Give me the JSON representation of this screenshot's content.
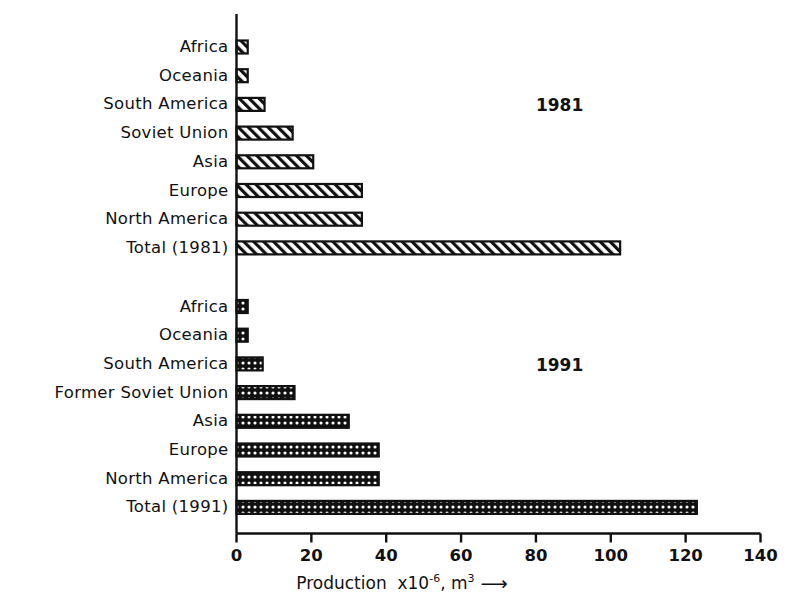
{
  "chart_data": {
    "type": "bar",
    "orientation": "horizontal",
    "title": "",
    "xlabel": "Production x10-6, m3",
    "xlabel_parts": {
      "lead": "Production",
      "factor_base": "x10",
      "factor_exp": "-6",
      "comma": ",",
      "unit_base": "m",
      "unit_exp": "3",
      "arrow": "⟶"
    },
    "ylabel": "",
    "xlim": [
      0,
      140
    ],
    "xticks": [
      0,
      20,
      40,
      60,
      80,
      100,
      120,
      140
    ],
    "xtick_labels": [
      "0",
      "20",
      "40",
      "60",
      "80",
      "100",
      "120",
      "140"
    ],
    "grid": false,
    "legend": "none",
    "annotations": [
      {
        "text": "1981",
        "x_value": 80,
        "group": "1981"
      },
      {
        "text": "1991",
        "x_value": 80,
        "group": "1991"
      }
    ],
    "groups": [
      {
        "name": "1981",
        "annotation": "1981",
        "pattern": "diagonal-hatch",
        "categories": [
          "Africa",
          "Oceania",
          "South America",
          "Soviet Union",
          "Asia",
          "Europe",
          "North America",
          "Total (1981)"
        ],
        "values": [
          3,
          3,
          7.5,
          15,
          20.5,
          33.5,
          33.5,
          102.5
        ]
      },
      {
        "name": "1991",
        "annotation": "1991",
        "pattern": "cross-hatch",
        "categories": [
          "Africa",
          "Oceania",
          "South America",
          "Former Soviet Union",
          "Asia",
          "Europe",
          "North America",
          "Total (1991)"
        ],
        "values": [
          3,
          3,
          7,
          15.5,
          30,
          38,
          38,
          123
        ]
      }
    ]
  },
  "colors": {
    "ink": "#111111",
    "background": "#ffffff",
    "bar_stroke": "#111111",
    "bar_fill_1981": "#ffffff",
    "bar_fill_1991": "#111111"
  }
}
